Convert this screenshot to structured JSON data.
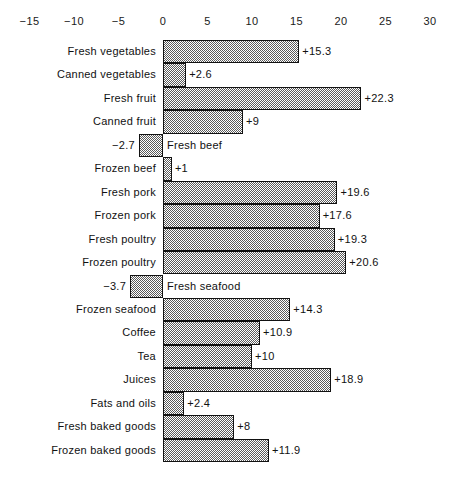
{
  "chart_data": {
    "type": "bar",
    "orientation": "horizontal",
    "title": "",
    "subtitle": "",
    "xlabel": "",
    "ylabel": "",
    "xlim": [
      -15,
      30
    ],
    "tick_step": 5,
    "grid": false,
    "legend": null,
    "zero_line": 0,
    "axis_position": "top",
    "tick_labels": [
      "−15",
      "−10",
      "−5",
      "0",
      "5",
      "10",
      "15",
      "20",
      "25",
      "30"
    ],
    "tick_values": [
      -15,
      -10,
      -5,
      0,
      5,
      10,
      15,
      20,
      25,
      30
    ],
    "categories": [
      "Fresh vegetables",
      "Canned vegetables",
      "Fresh fruit",
      "Canned fruit",
      "Fresh beef",
      "Frozen beef",
      "Fresh pork",
      "Frozen pork",
      "Fresh poultry",
      "Frozen poultry",
      "Fresh seafood",
      "Frozen seafood",
      "Coffee",
      "Tea",
      "Juices",
      "Fats and oils",
      "Fresh baked goods",
      "Frozen baked goods"
    ],
    "values": [
      15.3,
      2.6,
      22.3,
      9,
      -2.7,
      1,
      19.6,
      17.6,
      19.3,
      20.6,
      -3.7,
      14.3,
      10.9,
      10,
      18.9,
      2.4,
      8,
      11.9
    ],
    "value_labels": [
      "+15.3",
      "+2.6",
      "+22.3",
      "+9",
      "−2.7",
      "+1",
      "+19.6",
      "+17.6",
      "+19.3",
      "+20.6",
      "−3.7",
      "+14.3",
      "+10.9",
      "+10",
      "+18.9",
      "+2.4",
      "+8",
      "+11.9"
    ],
    "bars": [
      {
        "category": "Fresh vegetables",
        "value": 15.3,
        "label": "+15.3",
        "sign": "positive"
      },
      {
        "category": "Canned vegetables",
        "value": 2.6,
        "label": "+2.6",
        "sign": "positive"
      },
      {
        "category": "Fresh fruit",
        "value": 22.3,
        "label": "+22.3",
        "sign": "positive"
      },
      {
        "category": "Canned fruit",
        "value": 9,
        "label": "+9",
        "sign": "positive"
      },
      {
        "category": "Fresh beef",
        "value": -2.7,
        "label": "−2.7",
        "sign": "negative"
      },
      {
        "category": "Frozen beef",
        "value": 1,
        "label": "+1",
        "sign": "positive"
      },
      {
        "category": "Fresh pork",
        "value": 19.6,
        "label": "+19.6",
        "sign": "positive"
      },
      {
        "category": "Frozen pork",
        "value": 17.6,
        "label": "+17.6",
        "sign": "positive"
      },
      {
        "category": "Fresh poultry",
        "value": 19.3,
        "label": "+19.3",
        "sign": "positive"
      },
      {
        "category": "Frozen poultry",
        "value": 20.6,
        "label": "+20.6",
        "sign": "positive"
      },
      {
        "category": "Fresh seafood",
        "value": -3.7,
        "label": "−3.7",
        "sign": "negative"
      },
      {
        "category": "Frozen seafood",
        "value": 14.3,
        "label": "+14.3",
        "sign": "positive"
      },
      {
        "category": "Coffee",
        "value": 10.9,
        "label": "+10.9",
        "sign": "positive"
      },
      {
        "category": "Tea",
        "value": 10,
        "label": "+10",
        "sign": "positive"
      },
      {
        "category": "Juices",
        "value": 18.9,
        "label": "+18.9",
        "sign": "positive"
      },
      {
        "category": "Fats and oils",
        "value": 2.4,
        "label": "+2.4",
        "sign": "positive"
      },
      {
        "category": "Fresh baked goods",
        "value": 8,
        "label": "+8",
        "sign": "positive"
      },
      {
        "category": "Frozen baked goods",
        "value": 11.9,
        "label": "+11.9",
        "sign": "positive"
      }
    ],
    "colors": {
      "bar_fill": "#5a5a5a",
      "bar_border": "#111111",
      "text": "#111111",
      "background": "#ffffff"
    }
  },
  "geometry": {
    "zero_x": 163,
    "px_per_unit": 8.9,
    "row_height": 23.45,
    "plot_top": 40
  }
}
